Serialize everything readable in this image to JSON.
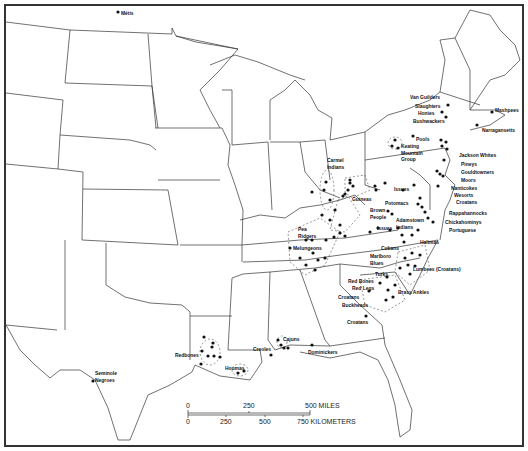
{
  "map": {
    "title": "",
    "groups": [
      {
        "id": "metis",
        "label": "Métis",
        "x": 121,
        "y": 11
      },
      {
        "id": "van-guilders",
        "label": "Van Guilders",
        "x": 413,
        "y": 94
      },
      {
        "id": "slaughters",
        "label": "Slaughters",
        "x": 415,
        "y": 104
      },
      {
        "id": "honies",
        "label": "Honies",
        "x": 418,
        "y": 111
      },
      {
        "id": "bushwackers",
        "label": "Bushwackers",
        "x": 413,
        "y": 119
      },
      {
        "id": "mashpees",
        "label": "Mashpees",
        "x": 495,
        "y": 107
      },
      {
        "id": "narragansetts",
        "label": "Narragansetts",
        "x": 482,
        "y": 127
      },
      {
        "id": "pools",
        "label": "Pools",
        "x": 413,
        "y": 136
      },
      {
        "id": "keating-mountain-group",
        "label": "Keating\nMountain\nGroup",
        "x": 398,
        "y": 143
      },
      {
        "id": "jackson-whites",
        "label": "Jackson Whites",
        "x": 460,
        "y": 152
      },
      {
        "id": "pineys",
        "label": "Pineys",
        "x": 461,
        "y": 162
      },
      {
        "id": "gouldtowners",
        "label": "Gouldtowners",
        "x": 461,
        "y": 170
      },
      {
        "id": "moors",
        "label": "Moors",
        "x": 461,
        "y": 177
      },
      {
        "id": "carmel-indians",
        "label": "Carmel\nIndians",
        "x": 327,
        "y": 157
      },
      {
        "id": "nanticokes",
        "label": "Nanticokes",
        "x": 451,
        "y": 185
      },
      {
        "id": "wesorts",
        "label": "Wesorts",
        "x": 454,
        "y": 193
      },
      {
        "id": "croatans-md",
        "label": "Croatans",
        "x": 456,
        "y": 199
      },
      {
        "id": "guineas",
        "label": "Guineas",
        "x": 352,
        "y": 196
      },
      {
        "id": "issues-va",
        "label": "Issues",
        "x": 394,
        "y": 186
      },
      {
        "id": "potomacs",
        "label": "Potomacs",
        "x": 385,
        "y": 200
      },
      {
        "id": "brown-people",
        "label": "Brown\nPeople",
        "x": 373,
        "y": 208
      },
      {
        "id": "rappahannocks",
        "label": "Rappahannocks",
        "x": 449,
        "y": 210
      },
      {
        "id": "chickahominys",
        "label": "Chickahominys",
        "x": 445,
        "y": 220
      },
      {
        "id": "adamstown-indians",
        "label": "Adamstown\nIndians",
        "x": 396,
        "y": 218
      },
      {
        "id": "portuguese",
        "label": "Portuguese",
        "x": 449,
        "y": 228
      },
      {
        "id": "issues-ky",
        "label": "Issues",
        "x": 377,
        "y": 225
      },
      {
        "id": "pea-ridgers",
        "label": "Pea\nRidgers",
        "x": 297,
        "y": 226
      },
      {
        "id": "halimas",
        "label": "Halimas",
        "x": 420,
        "y": 240
      },
      {
        "id": "melungeons",
        "label": "Melungeons",
        "x": 293,
        "y": 245
      },
      {
        "id": "cubans",
        "label": "Cubans",
        "x": 381,
        "y": 246
      },
      {
        "id": "marlboro-blues",
        "label": "Marlboro\nBlues",
        "x": 370,
        "y": 255
      },
      {
        "id": "lumbees",
        "label": "Lumbees (Croatans)",
        "x": 413,
        "y": 266
      },
      {
        "id": "turks",
        "label": "Turks",
        "x": 375,
        "y": 272
      },
      {
        "id": "red-bones",
        "label": "Red Bones",
        "x": 348,
        "y": 278
      },
      {
        "id": "red-legs",
        "label": "Red Legs",
        "x": 352,
        "y": 285
      },
      {
        "id": "brass-ankles",
        "label": "Brass Ankles",
        "x": 398,
        "y": 290
      },
      {
        "id": "croatans-sc",
        "label": "Croatans",
        "x": 338,
        "y": 294
      },
      {
        "id": "buckheads",
        "label": "Buckheads",
        "x": 342,
        "y": 302
      },
      {
        "id": "croatans-ga",
        "label": "Croatans",
        "x": 347,
        "y": 319
      },
      {
        "id": "cajuns",
        "label": "Cajuns",
        "x": 282,
        "y": 337
      },
      {
        "id": "creoles",
        "label": "Creoles",
        "x": 254,
        "y": 346
      },
      {
        "id": "dominickers",
        "label": "Dominickers",
        "x": 308,
        "y": 349
      },
      {
        "id": "redbones",
        "label": "Redbones",
        "x": 176,
        "y": 352
      },
      {
        "id": "houmas",
        "label": "Houmas",
        "x": 225,
        "y": 366
      },
      {
        "id": "seminole-negroes",
        "label": "Seminole\nNegroes",
        "x": 95,
        "y": 370
      }
    ],
    "scale_bar": {
      "miles_ticks": [
        "0",
        "250",
        "500 MILES"
      ],
      "km_ticks": [
        "0",
        "250",
        "500",
        "750 KILOMETERS"
      ]
    },
    "colors": {
      "line": "#222222",
      "background": "#ffffff",
      "dot": "#111111"
    }
  }
}
